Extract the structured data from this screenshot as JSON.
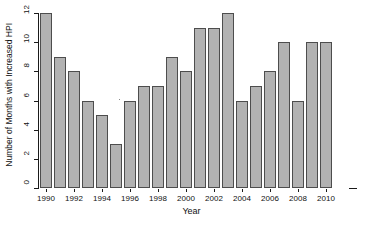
{
  "chart_data": {
    "type": "bar",
    "title": "",
    "xlabel": "Year",
    "ylabel": "Number of Months with Increased HPI",
    "categories": [
      "1990",
      "1991",
      "1992",
      "1993",
      "1994",
      "1995",
      "1996",
      "1997",
      "1998",
      "1999",
      "2000",
      "2001",
      "2002",
      "2003",
      "2004",
      "2005",
      "2006",
      "2007",
      "2008",
      "2009",
      "2010"
    ],
    "values": [
      12,
      9,
      8,
      6,
      5,
      3,
      6,
      7,
      7,
      9,
      8,
      11,
      11,
      12,
      6,
      7,
      8,
      10,
      6,
      10,
      10
    ],
    "ylim": [
      0,
      12
    ],
    "y_ticks": [
      "0",
      "2",
      "4",
      "6",
      "8",
      "10",
      "12"
    ],
    "y_tick_values": [
      0,
      2,
      4,
      6,
      8,
      10,
      12
    ],
    "x_tick_labels": [
      "1990",
      "1992",
      "1994",
      "1996",
      "1998",
      "2000",
      "2002",
      "2004",
      "2006",
      "2008",
      "2010"
    ],
    "x_tick_indices": [
      0,
      2,
      4,
      6,
      8,
      10,
      12,
      14,
      16,
      18,
      20
    ],
    "grid": false,
    "legend": null,
    "colors": {
      "bar_fill": "#b2b2b2",
      "bar_border": "#4d4d4d",
      "axis": "#1a1a1a",
      "text": "#111111",
      "background": "#ffffff"
    }
  }
}
